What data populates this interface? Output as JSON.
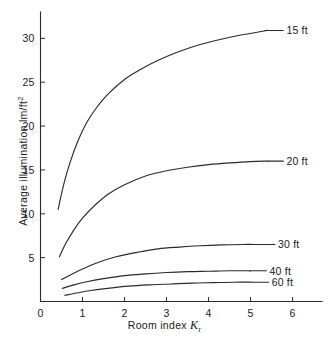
{
  "chart_data": {
    "type": "line",
    "title": "",
    "subtitle": "",
    "xlabel": "Room index",
    "xlabel_symbol": "K",
    "xlabel_symbol_sub": "r",
    "ylabel": "Average illumination lm/ft",
    "ylabel_exponent": "2",
    "xlim": [
      0,
      6.7
    ],
    "ylim": [
      0,
      33
    ],
    "grid": false,
    "legend_position": "right-of-curve-ends",
    "xticks": [
      0,
      1,
      2,
      3,
      4,
      5,
      6
    ],
    "xtick_labels": [
      "0",
      "1",
      "2",
      "3",
      "4",
      "5",
      "6"
    ],
    "yticks": [
      5,
      10,
      15,
      20,
      25,
      30
    ],
    "ytick_labels": [
      "5",
      "10",
      "15",
      "20",
      "25",
      "30"
    ],
    "series": [
      {
        "name": "15 ft",
        "label": "15 ft",
        "x": [
          0.42,
          0.55,
          0.7,
          0.9,
          1.1,
          1.35,
          1.6,
          2.0,
          2.4,
          2.8,
          3.3,
          3.8,
          4.3,
          4.8,
          5.4
        ],
        "values": [
          10.5,
          13.3,
          15.8,
          18.4,
          20.4,
          22.2,
          23.6,
          25.3,
          26.5,
          27.5,
          28.5,
          29.3,
          29.9,
          30.4,
          30.9
        ]
      },
      {
        "name": "20 ft",
        "label": "20 ft",
        "x": [
          0.45,
          0.6,
          0.8,
          1.0,
          1.3,
          1.6,
          2.0,
          2.5,
          3.0,
          3.5,
          4.0,
          4.5,
          5.0,
          5.4
        ],
        "values": [
          5.1,
          6.6,
          8.2,
          9.5,
          11.0,
          12.2,
          13.3,
          14.3,
          14.9,
          15.3,
          15.6,
          15.8,
          15.95,
          16.0
        ]
      },
      {
        "name": "30 ft",
        "label": "30 ft",
        "x": [
          0.5,
          0.7,
          1.0,
          1.4,
          1.8,
          2.3,
          2.8,
          3.3,
          3.8,
          4.3,
          4.8,
          5.2
        ],
        "values": [
          2.5,
          3.0,
          3.7,
          4.5,
          5.1,
          5.6,
          6.0,
          6.2,
          6.35,
          6.45,
          6.5,
          6.5
        ]
      },
      {
        "name": "40 ft",
        "label": "40 ft",
        "x": [
          0.52,
          0.8,
          1.1,
          1.5,
          2.0,
          2.5,
          3.0,
          3.5,
          4.0,
          4.5,
          5.0
        ],
        "values": [
          1.5,
          1.9,
          2.25,
          2.6,
          2.95,
          3.15,
          3.3,
          3.4,
          3.45,
          3.5,
          3.5
        ]
      },
      {
        "name": "60 ft",
        "label": "60 ft",
        "x": [
          0.58,
          0.9,
          1.2,
          1.6,
          2.1,
          2.6,
          3.1,
          3.6,
          4.1,
          4.6,
          5.05
        ],
        "values": [
          0.7,
          1.0,
          1.25,
          1.5,
          1.75,
          1.9,
          2.0,
          2.1,
          2.15,
          2.2,
          2.2
        ]
      }
    ],
    "colors": {
      "curve": "#2b2b2b",
      "axis": "#2b2b2b",
      "background": "#ffffff",
      "text": "#1a1a1a"
    }
  }
}
